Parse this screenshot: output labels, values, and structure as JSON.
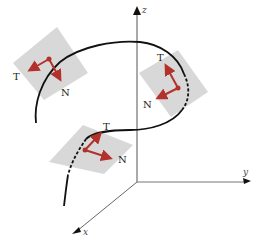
{
  "figure": {
    "axes": {
      "z_label": "z",
      "y_label": "y",
      "x_label": "x"
    },
    "frames": [
      {
        "id": "upper-left",
        "tangent_label": "T",
        "normal_label": "N"
      },
      {
        "id": "right",
        "tangent_label": "T",
        "normal_label": "N"
      },
      {
        "id": "lower-center",
        "tangent_label": "T",
        "normal_label": "N"
      }
    ],
    "colors": {
      "vector": "#b2312b",
      "plane": "#d4d4d4",
      "curve": "#111111",
      "axis": "#555555"
    }
  }
}
